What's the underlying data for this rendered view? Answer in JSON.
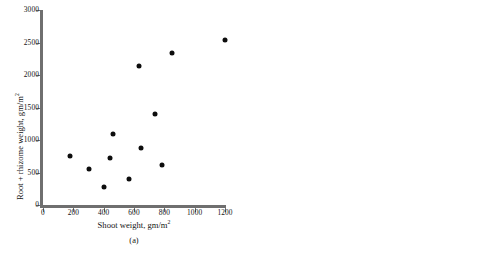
{
  "figure": {
    "background": "#ffffff",
    "dot_color": "#0d0d0d",
    "axis_color": "#6f6f6f"
  },
  "chart_data": [
    {
      "type": "scatter",
      "panel": "(a)",
      "title": "",
      "xlabel": "Shoot weight, gm/m",
      "xlabel_sup": "2",
      "ylabel": "Root + rhizome weight, gm/m",
      "ylabel_sup": "2",
      "xlim": [
        0,
        1200
      ],
      "ylim": [
        0,
        3000
      ],
      "xticks": [
        0,
        200,
        400,
        600,
        800,
        1000,
        1200
      ],
      "yticks": [
        0,
        500,
        1000,
        1500,
        2000,
        2500,
        3000
      ],
      "xticklabels": [
        "0",
        "200",
        "400",
        "600",
        "800",
        "1000",
        "1200"
      ],
      "yticklabels": [
        "0",
        "500",
        "1000",
        "1500",
        "2000",
        "2500",
        "3000"
      ],
      "grid": false,
      "legend": false,
      "axis_break": false,
      "points": [
        {
          "x": 175,
          "y": 750
        },
        {
          "x": 305,
          "y": 560
        },
        {
          "x": 400,
          "y": 270
        },
        {
          "x": 445,
          "y": 730
        },
        {
          "x": 460,
          "y": 1090
        },
        {
          "x": 570,
          "y": 400
        },
        {
          "x": 630,
          "y": 2140
        },
        {
          "x": 645,
          "y": 870
        },
        {
          "x": 740,
          "y": 1400
        },
        {
          "x": 785,
          "y": 610
        },
        {
          "x": 850,
          "y": 2340
        },
        {
          "x": 1200,
          "y": 2540
        }
      ]
    },
    {
      "type": "scatter",
      "panel": "(b)",
      "title": "",
      "xlabel": "Height, cm",
      "xlabel_sup": "",
      "ylabel": "Number of rhizomes",
      "ylabel_sup": "",
      "xlim": [
        0,
        140
      ],
      "ylim": [
        0,
        30
      ],
      "xticks": [
        0,
        80,
        100,
        120,
        140
      ],
      "yticks": [
        0,
        5,
        10,
        15,
        20,
        25,
        30
      ],
      "xticklabels": [
        "0",
        "80",
        "100",
        "120",
        "140"
      ],
      "yticklabels": [
        "0",
        "5",
        "10",
        "15",
        "20",
        "25",
        "30"
      ],
      "grid": false,
      "legend": false,
      "axis_break": true,
      "axis_break_symbol": "⁄⁄",
      "points": [
        {
          "x": 78,
          "y": 15
        },
        {
          "x": 105,
          "y": 10
        },
        {
          "x": 110,
          "y": 13
        },
        {
          "x": 112,
          "y": 10
        },
        {
          "x": 113,
          "y": 14
        },
        {
          "x": 121,
          "y": 12.6
        },
        {
          "x": 121,
          "y": 11.8
        },
        {
          "x": 140,
          "y": 12
        },
        {
          "x": 140,
          "y": 4
        }
      ]
    }
  ]
}
